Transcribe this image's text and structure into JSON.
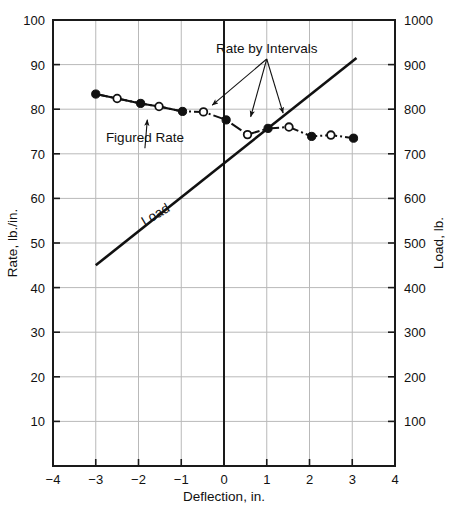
{
  "chart_data": {
    "type": "line",
    "title": "",
    "xlabel": "Deflection, in.",
    "ylabel": "Rate, lb./in.",
    "y2label": "Load, lb.",
    "xlim": [
      -4,
      4
    ],
    "ylim": [
      0,
      100
    ],
    "y2lim": [
      0,
      1000
    ],
    "xticks": [
      -4,
      -3,
      -2,
      -1,
      0,
      1,
      2,
      3,
      4
    ],
    "xticklabels": [
      "−4",
      "−3",
      "−2",
      "−1",
      "0",
      "1",
      "2",
      "3",
      "4"
    ],
    "yticks": [
      10,
      20,
      30,
      40,
      50,
      60,
      70,
      80,
      90,
      100
    ],
    "yticklabels": [
      "10",
      "20",
      "30",
      "40",
      "50",
      "60",
      "70",
      "80",
      "90",
      "100"
    ],
    "y2ticks": [
      100,
      200,
      300,
      400,
      500,
      600,
      700,
      800,
      900,
      1000
    ],
    "y2ticklabels": [
      "100",
      "200",
      "300",
      "400",
      "500",
      "600",
      "700",
      "800",
      "900",
      "1000"
    ],
    "grid": true,
    "legend": "none",
    "series": [
      {
        "name": "Figured Rate",
        "marker": "filled-circle",
        "linestyle": "dashdot",
        "axis": "left",
        "points": [
          {
            "x": -3.0,
            "y": 83.4
          },
          {
            "x": -1.95,
            "y": 81.3
          },
          {
            "x": -0.97,
            "y": 79.5
          },
          {
            "x": 0.05,
            "y": 77.6
          },
          {
            "x": 1.03,
            "y": 75.7
          },
          {
            "x": 2.05,
            "y": 73.9
          },
          {
            "x": 3.03,
            "y": 73.5
          }
        ]
      },
      {
        "name": "Rate by Intervals",
        "marker": "open-circle",
        "linestyle": "dashdot",
        "axis": "left",
        "points": [
          {
            "x": -2.5,
            "y": 82.4
          },
          {
            "x": -1.52,
            "y": 80.6
          },
          {
            "x": -0.48,
            "y": 79.4
          },
          {
            "x": 0.55,
            "y": 74.3
          },
          {
            "x": 1.52,
            "y": 76.0
          },
          {
            "x": 2.5,
            "y": 74.2
          }
        ]
      },
      {
        "name": "Load",
        "marker": "none",
        "linestyle": "solid",
        "axis": "right",
        "points": [
          {
            "x": -3.0,
            "y": 45.0
          },
          {
            "x": 3.1,
            "y": 91.5
          }
        ]
      }
    ],
    "annotations": [
      {
        "text": "Rate by Intervals",
        "x": 1.0,
        "y": 92.6,
        "anchor": "middle",
        "targets": [
          {
            "x": -0.4,
            "y": 79.9
          },
          {
            "x": 0.58,
            "y": 76.8
          },
          {
            "x": 1.43,
            "y": 77.6
          }
        ]
      },
      {
        "text": "Figured Rate",
        "x": -1.85,
        "y": 72.6,
        "anchor": "middle",
        "targets": [
          {
            "x": -1.78,
            "y": 79.2
          }
        ]
      },
      {
        "text": "Load",
        "x": -1.55,
        "y": 55.5,
        "anchor": "middle",
        "rotation": -31,
        "inline": true
      }
    ]
  },
  "axes": {
    "x_title": "Deflection, in.",
    "y_left_title": "Rate, lb./in.",
    "y_right_title": "Load, lb."
  },
  "colors": {
    "ink": "#111111",
    "grid": "#b9b9b9",
    "frame": "#1a1a1a",
    "background": "#ffffff"
  }
}
